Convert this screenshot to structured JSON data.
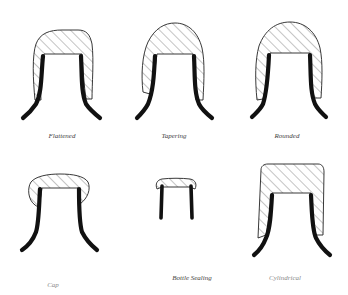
{
  "diagram": {
    "title": "",
    "colors": {
      "background": "#ffffff",
      "outline": "#222222",
      "neck": "#111111",
      "hatch": "#555555"
    },
    "shapes": [
      {
        "id": "flattened",
        "label": "Flattened",
        "label_pos": [
          62,
          137
        ]
      },
      {
        "id": "tapering",
        "label": "Tapering",
        "label_pos": [
          174,
          137
        ]
      },
      {
        "id": "rounded",
        "label": "Rounded",
        "label_pos": [
          287,
          137
        ]
      },
      {
        "id": "cap",
        "label": "Cap",
        "label_pos": [
          53,
          286
        ]
      },
      {
        "id": "bottle-sealing",
        "label": "Bottle Sealing",
        "label_pos": [
          192,
          279
        ]
      },
      {
        "id": "cylindrical",
        "label": "Cylindrical",
        "label_pos": [
          285,
          279
        ]
      }
    ]
  }
}
